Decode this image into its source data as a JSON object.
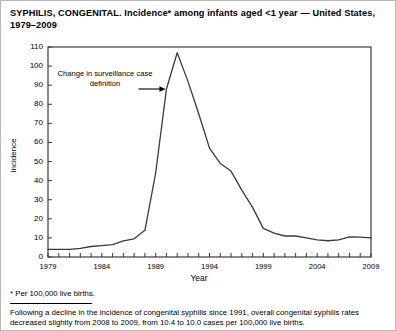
{
  "figure": {
    "title": "SYPHILIS, CONGENITAL. Incidence* among infants aged <1 year — United States, 1979–2009",
    "footnote": "* Per 100,000 live births.",
    "caption": "Following a decline in the incidence of congenital syphilis since 1991, overall congenital syphilis rates decreased slightly from 2008 to 2009, from 10.4 to 10.0 cases per 100,000 live births.",
    "annotation": "Change in surveillance case definition"
  },
  "chart_data": {
    "type": "line",
    "title": "SYPHILIS, CONGENITAL. Incidence* among infants aged <1 year — United States, 1979–2009",
    "xlabel": "Year",
    "ylabel": "Incidence",
    "xlim": [
      1979,
      2009
    ],
    "ylim": [
      0,
      110
    ],
    "ytick_step": 10,
    "yticks": [
      0,
      10,
      20,
      30,
      40,
      50,
      60,
      70,
      80,
      90,
      100,
      110
    ],
    "xticks_labeled": [
      1979,
      1984,
      1989,
      1994,
      1999,
      2004,
      2009
    ],
    "xtick_interval": 1,
    "grid": false,
    "legend": false,
    "line_color": "#3a3a3a",
    "x": [
      1979,
      1980,
      1981,
      1982,
      1983,
      1984,
      1985,
      1986,
      1987,
      1988,
      1989,
      1990,
      1991,
      1992,
      1993,
      1994,
      1995,
      1996,
      1997,
      1998,
      1999,
      2000,
      2001,
      2002,
      2003,
      2004,
      2005,
      2006,
      2007,
      2008,
      2009
    ],
    "values": [
      4.0,
      4.0,
      4.0,
      4.5,
      5.5,
      6.0,
      6.5,
      8.5,
      9.5,
      14.0,
      44.0,
      88.0,
      107.0,
      92.0,
      75.0,
      57.0,
      49.0,
      45.0,
      35.0,
      26.0,
      15.0,
      12.5,
      11.0,
      11.0,
      10.0,
      9.0,
      8.5,
      9.0,
      10.5,
      10.4,
      10.0
    ],
    "annotations": [
      {
        "text": "Change in surveillance case definition",
        "points_to_year": 1990,
        "points_to_value": 88.0
      }
    ]
  }
}
